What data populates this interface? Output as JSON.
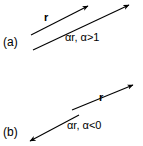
{
  "figure": {
    "background_color": "#ffffff",
    "stroke_color": "#000000",
    "panels": [
      {
        "tag": "(a)",
        "vectors": [
          {
            "label": "r",
            "kind": "base-vector"
          },
          {
            "label": "αr, α>1",
            "kind": "scaled-vector"
          }
        ]
      },
      {
        "tag": "(b)",
        "vectors": [
          {
            "label": "r",
            "kind": "base-vector"
          },
          {
            "label": "αr, α<0",
            "kind": "scaled-vector"
          }
        ]
      }
    ]
  },
  "labels": {
    "panel_a_tag": "(a)",
    "panel_b_tag": "(b)",
    "panel_a_r": "r",
    "panel_a_scaled": "αr, α>1",
    "panel_b_r": "r",
    "panel_b_scaled": "αr, α<0"
  }
}
